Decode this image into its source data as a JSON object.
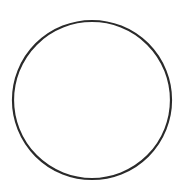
{
  "canvas": {
    "width": 174,
    "height": 181,
    "background": "#ffffff"
  },
  "shape": {
    "type": "circle",
    "cx": 92,
    "cy": 100,
    "r": 79,
    "stroke": "#2a2a2a",
    "stroke_width": 2.2,
    "fill": "none"
  }
}
